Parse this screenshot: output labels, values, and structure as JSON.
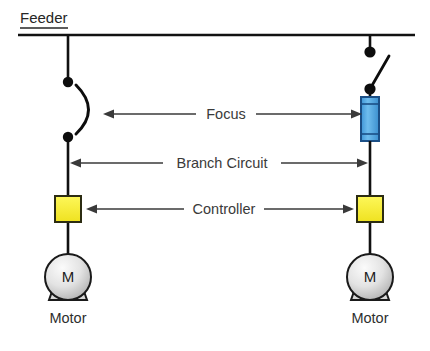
{
  "diagram": {
    "canvas": {
      "width": 430,
      "height": 351,
      "background": "#ffffff"
    },
    "feeder": {
      "label": "Feeder",
      "bus_y": 35,
      "bus_x_start": 18,
      "bus_x_end": 415
    },
    "labels": {
      "focus": "Focus",
      "branch_circuit": "Branch Circuit",
      "controller": "Controller",
      "motor_left": "Motor",
      "motor_right": "Motor",
      "motor_symbol_left": "M",
      "motor_symbol_right": "M"
    },
    "colors": {
      "wire": "#111111",
      "node": "#0d0d0d",
      "fuse_fill": "#4da3e0",
      "fuse_fill_dark": "#2d8ccd",
      "fuse_stroke": "#1b4f86",
      "controller_fill": "#f5eb3b",
      "controller_stroke": "#2c2c12",
      "motor_fill_light": "#f2f2f2",
      "motor_fill_dark": "#b4b4b4",
      "motor_stroke": "#1a1a1a",
      "text": "#3a3a3a",
      "dimension_line": "#3a3a3a"
    },
    "branches": [
      {
        "id": "left-branch",
        "conductor_x": 68,
        "protective_device": "circuit-breaker-arc",
        "device_top_node_y": 82,
        "device_bottom_node_y": 137,
        "controller": {
          "x": 68,
          "y": 209,
          "size": 26,
          "fill": "#f5eb3b"
        },
        "motor": {
          "cx": 68,
          "cy": 277,
          "r": 23,
          "symbol": "M",
          "label": "Motor"
        }
      },
      {
        "id": "right-branch",
        "conductor_x": 370,
        "protective_device": "knife-switch-with-fuse",
        "device_top_node_y": 52,
        "device_bottom_node_y": 89,
        "fuse": {
          "x": 361,
          "y": 97,
          "width": 18,
          "height": 44,
          "fill": "#4da3e0"
        },
        "controller": {
          "x": 370,
          "y": 209,
          "size": 26,
          "fill": "#f5eb3b"
        },
        "motor": {
          "cx": 370,
          "cy": 277,
          "r": 23,
          "symbol": "M",
          "label": "Motor"
        }
      }
    ],
    "dimensions": [
      {
        "name": "focus",
        "label": "Focus",
        "y": 114,
        "x_start": 103,
        "x_end": 362,
        "arrows": "both"
      },
      {
        "name": "branch-circuit",
        "label": "Branch Circuit",
        "y": 163,
        "x_start": 70,
        "x_end": 368,
        "arrows": "both"
      },
      {
        "name": "controller",
        "label": "Controller",
        "y": 209,
        "x_start": 86,
        "x_end": 354,
        "arrows": "both"
      }
    ]
  }
}
